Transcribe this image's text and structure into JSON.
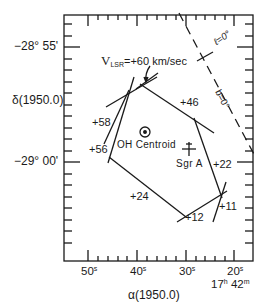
{
  "figure": {
    "y_axis": {
      "label": "δ(1950.0)",
      "ticks": [
        {
          "label": "−28° 55'"
        },
        {
          "label": "−29° 00'"
        }
      ]
    },
    "x_axis": {
      "label": "α(1950.0)",
      "ticks": [
        {
          "main": "50",
          "sup": "s"
        },
        {
          "main": "40",
          "sup": "s"
        },
        {
          "main": "30",
          "sup": "s"
        },
        {
          "main": "20",
          "sup": "s"
        }
      ],
      "hour_label": {
        "h": "17",
        "h_sup": "h",
        "m": " 42",
        "m_sup": "m"
      }
    },
    "annotations": {
      "vlsr_prefix": "V",
      "vlsr_sub": "LSR",
      "vlsr_value": "=+60 km/sec",
      "galactic_l": "ℓ=0°",
      "galactic_b": "b=0°",
      "oh_centroid": "OH Centroid",
      "sgr_a": "Sgr A"
    },
    "velocities": [
      {
        "id": "v46",
        "label": "+46"
      },
      {
        "id": "v58",
        "label": "+58"
      },
      {
        "id": "v56",
        "label": "+56"
      },
      {
        "id": "v22",
        "label": "+22"
      },
      {
        "id": "v24",
        "label": "+24"
      },
      {
        "id": "v11",
        "label": "+11"
      },
      {
        "id": "v12",
        "label": "+12"
      }
    ],
    "colors": {
      "ink": "#1a1a1a",
      "background": "#ffffff"
    }
  }
}
